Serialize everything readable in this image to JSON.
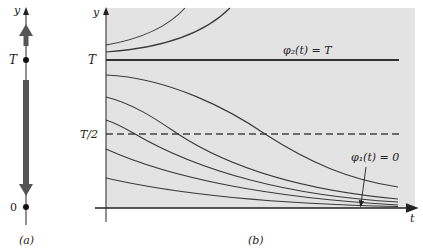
{
  "panel_a": {
    "caption": "(a)",
    "axis_label": "y",
    "tick_T": "T",
    "tick_zero": "0"
  },
  "panel_b": {
    "caption": "(b)",
    "y_axis_label": "y",
    "x_axis_label": "t",
    "tick_T": "T",
    "tick_T_half": "T/2",
    "phi2_label": "φ₂(t) = T",
    "phi1_label": "φ₁(t) = 0"
  },
  "colors": {
    "panel_background": "#e3e3e3",
    "curve": "#3a3a3a",
    "arrow": "#555555",
    "axis": "#222222"
  }
}
